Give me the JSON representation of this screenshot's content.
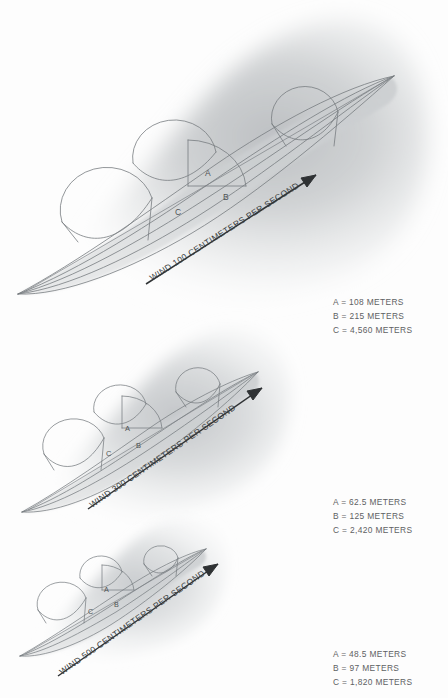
{
  "figure": {
    "type": "scientific-diagram",
    "background_color": "#fdfdfd",
    "ink_color": "#6b7074",
    "plume_fill_color": "#c9cbcd"
  },
  "panels": [
    {
      "id": "panel-1",
      "wind_label": "WIND 100 CENTIMETERS PER SECOND",
      "dimension_labels": {
        "a": "A",
        "b": "B",
        "c": "C"
      },
      "legend": [
        "A = 108 METERS",
        "B = 215 METERS",
        "C = 4,560 METERS"
      ],
      "measurements": {
        "a_meters": 108,
        "b_meters": 215,
        "c_meters": 4560,
        "wind_speed_cm_per_second": 100
      }
    },
    {
      "id": "panel-2",
      "wind_label": "WIND 300 CENTIMETERS PER SECOND",
      "dimension_labels": {
        "a": "A",
        "b": "B",
        "c": "C"
      },
      "legend": [
        "A = 62.5 METERS",
        "B = 125 METERS",
        "C = 2,420 METERS"
      ],
      "measurements": {
        "a_meters": 62.5,
        "b_meters": 125,
        "c_meters": 2420,
        "wind_speed_cm_per_second": 300
      }
    },
    {
      "id": "panel-3",
      "wind_label": "WIND 500 CENTIMETERS PER SECOND",
      "dimension_labels": {
        "a": "A",
        "b": "B",
        "c": "C"
      },
      "legend": [
        "A = 48.5 METERS",
        "B = 97 METERS",
        "C = 1,820 METERS"
      ],
      "measurements": {
        "a_meters": 48.5,
        "b_meters": 97,
        "c_meters": 1820,
        "wind_speed_cm_per_second": 500
      }
    }
  ]
}
